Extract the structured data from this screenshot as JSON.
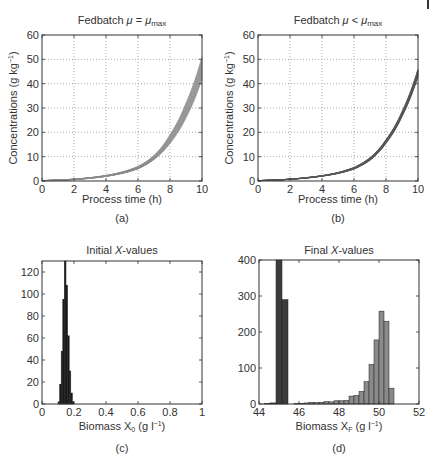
{
  "chart_data": [
    {
      "id": "a",
      "type": "line",
      "title": "Fedbatch μ = μmax",
      "title_parts": {
        "prefix": "Fedbatch ",
        "mu": "μ",
        "op": " = ",
        "mu2": "μ",
        "sub": "max"
      },
      "xlabel": "Process time (h)",
      "ylabel": "Concentrations (g kg⁻¹)",
      "ylabel_parts": {
        "main": "Concentrations (g kg",
        "sup": "−1",
        "end": ")"
      },
      "caption": "(a)",
      "xlim": [
        0,
        10
      ],
      "ylim": [
        0,
        60
      ],
      "xticks": [
        0,
        2,
        4,
        6,
        8,
        10
      ],
      "yticks": [
        0,
        10,
        20,
        30,
        40,
        50,
        60
      ],
      "grid": true,
      "line_color": "#8a8a8a",
      "band_description": "ensemble of many exponential trajectories",
      "x": [
        0,
        1,
        2,
        3,
        4,
        5,
        6,
        7,
        8,
        9,
        10
      ],
      "series": [
        {
          "name": "upper",
          "values": [
            0.2,
            0.4,
            0.8,
            1.4,
            2.3,
            3.7,
            6.0,
            10.5,
            19.0,
            32.0,
            51.0
          ]
        },
        {
          "name": "lower",
          "values": [
            0.15,
            0.3,
            0.6,
            1.1,
            1.9,
            3.1,
            5.0,
            8.8,
            15.5,
            26.0,
            42.0
          ]
        }
      ]
    },
    {
      "id": "b",
      "type": "line",
      "title": "Fedbatch μ < μmax",
      "title_parts": {
        "prefix": "Fedbatch ",
        "mu": "μ",
        "op": " < ",
        "mu2": "μ",
        "sub": "max"
      },
      "xlabel": "Process time (h)",
      "ylabel": "Concentrations (g kg⁻¹)",
      "ylabel_parts": {
        "main": "Concentrations (g kg",
        "sup": "−1",
        "end": ")"
      },
      "caption": "(b)",
      "xlim": [
        0,
        10
      ],
      "ylim": [
        0,
        60
      ],
      "xticks": [
        0,
        2,
        4,
        6,
        8,
        10
      ],
      "yticks": [
        0,
        10,
        20,
        30,
        40,
        50,
        60
      ],
      "grid": true,
      "line_color": "#555555",
      "x": [
        0,
        1,
        2,
        3,
        4,
        5,
        6,
        7,
        8,
        9,
        10
      ],
      "series": [
        {
          "name": "upper",
          "values": [
            0.2,
            0.4,
            0.8,
            1.4,
            2.2,
            3.5,
            5.6,
            9.6,
            17.0,
            28.5,
            46.0
          ]
        },
        {
          "name": "lower",
          "values": [
            0.15,
            0.35,
            0.7,
            1.2,
            2.0,
            3.1,
            4.9,
            8.5,
            15.5,
            26.5,
            43.0
          ]
        }
      ]
    },
    {
      "id": "c",
      "type": "bar",
      "subtype": "histogram",
      "title": "Initial X-values",
      "title_parts": {
        "prefix": "Initial ",
        "var": "X",
        "suffix": "-values"
      },
      "xlabel": "Biomass X0 (g l⁻¹)",
      "xlabel_parts": {
        "main": "Biomass X",
        "sub": "0",
        "units": " (g l",
        "sup": "−1",
        "end": ")"
      },
      "caption": "(c)",
      "xlim": [
        0,
        1
      ],
      "ylim": [
        0,
        130
      ],
      "xticks": [
        0,
        0.2,
        0.4,
        0.6,
        0.8,
        1
      ],
      "xtick_labels": [
        "0",
        "0.2",
        "0.4",
        "0.6",
        "0.8",
        "1"
      ],
      "yticks": [
        0,
        20,
        40,
        60,
        80,
        100,
        120
      ],
      "grid": false,
      "bar_color": "#1a1a1a",
      "bin_width": 0.01,
      "bins": [
        0.1,
        0.11,
        0.12,
        0.13,
        0.14,
        0.15,
        0.16,
        0.17,
        0.18,
        0.19
      ],
      "values": [
        2,
        18,
        48,
        95,
        130,
        108,
        62,
        30,
        10,
        2
      ]
    },
    {
      "id": "d",
      "type": "bar",
      "subtype": "histogram",
      "title": "Final X-values",
      "title_parts": {
        "prefix": "Final ",
        "var": "X",
        "suffix": "-values"
      },
      "xlabel": "Biomass XF (g l⁻¹)",
      "xlabel_parts": {
        "main": "Biomass X",
        "sub": "F",
        "units": " (g l",
        "sup": "−1",
        "end": ")"
      },
      "caption": "(d)",
      "xlim": [
        44,
        52
      ],
      "ylim": [
        0,
        400
      ],
      "xticks": [
        44,
        46,
        48,
        50,
        52
      ],
      "yticks": [
        0,
        100,
        200,
        300,
        400
      ],
      "grid": false,
      "series": [
        {
          "name": "mu < mu_max (dark)",
          "color": "#3c3c3c",
          "bin_width": 0.3,
          "bins": [
            44.25,
            44.55,
            44.85,
            45.15
          ],
          "values": [
            1,
            3,
            400,
            290
          ]
        },
        {
          "name": "mu = mu_max (light)",
          "color": "#8a8a8a",
          "bin_width": 0.25,
          "bins": [
            45.75,
            46.0,
            46.25,
            46.5,
            46.75,
            47.0,
            47.25,
            47.5,
            47.75,
            48.0,
            48.25,
            48.5,
            48.75,
            49.0,
            49.25,
            49.5,
            49.75,
            50.0,
            50.25,
            50.5
          ],
          "values": [
            1,
            2,
            3,
            5,
            4,
            5,
            7,
            6,
            9,
            9,
            10,
            22,
            24,
            35,
            62,
            110,
            178,
            258,
            230,
            44
          ]
        }
      ]
    }
  ]
}
